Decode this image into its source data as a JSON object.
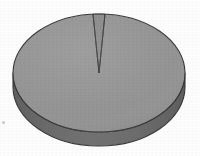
{
  "figure": {
    "name": "3d-pie-chart",
    "width": 200,
    "height": 156,
    "background_color": "#fdfdfd",
    "title": "",
    "caption": ""
  },
  "geometry": {
    "center_x": 99,
    "center_y": 73,
    "radius_x": 86,
    "radius_y": 59,
    "depth": 14,
    "start_angle_deg": -90
  },
  "colors": {
    "top_face": "#949494",
    "side_face": "#6a6a6a",
    "sliver_top_face": "#8a8a8a",
    "outline": "#3a3a3a",
    "background": "#fdfdfd",
    "speck": "#c9c9c9"
  },
  "artifacts": [
    {
      "name": "scan-speck-left",
      "x": 2,
      "y": 121,
      "size": 3
    }
  ],
  "chart_data": {
    "type": "pie",
    "title": "",
    "subtitle": "",
    "xlabel": "",
    "ylabel": "",
    "grid": false,
    "legend_position": "none",
    "three_d": true,
    "labels": [
      "Majority share",
      "Minority sliver"
    ],
    "values": [
      98,
      2
    ],
    "units": "percent",
    "slices": [
      {
        "label": "Majority share",
        "value": 98,
        "percent": "98%",
        "color": "#949494",
        "side_color": "#6a6a6a",
        "start_angle_deg": -86,
        "end_angle_deg": 270
      },
      {
        "label": "Minority sliver",
        "value": 2,
        "percent": "2%",
        "color": "#8a8a8a",
        "side_color": "#6a6a6a",
        "start_angle_deg": -94,
        "end_angle_deg": -86
      }
    ],
    "annotations": []
  }
}
